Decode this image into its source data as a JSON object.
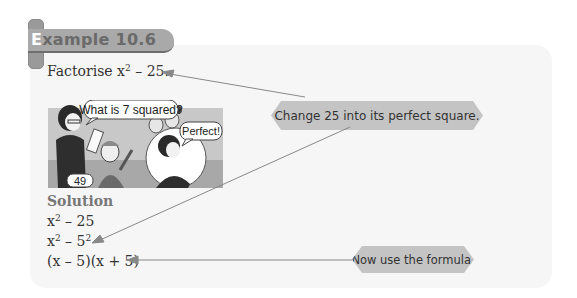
{
  "header": {
    "title_first_letter": "E",
    "title_rest": "xample 10.6"
  },
  "question": {
    "prefix": "Factorise x",
    "exp": "2",
    "suffix": " – 25."
  },
  "illustration": {
    "teacher_bubble": "What is 7 squared?",
    "student_bubble": "49",
    "teacher_reply_bubble": "Perfect!"
  },
  "callouts": [
    {
      "text": "Change 25 into its perfect square."
    },
    {
      "text": "Now use the formula."
    }
  ],
  "solution": {
    "label": "Solution",
    "steps": [
      {
        "base": "x",
        "exp": "2",
        "rest": " – 25"
      },
      {
        "base": "x",
        "exp": "2",
        "mid": " – 5",
        "exp2": "2"
      },
      {
        "text": "(x – 5)(x + 5)"
      }
    ]
  },
  "colors": {
    "panel_bg": "#f6f6f6",
    "tab_bg": "#a9a9a9",
    "callout_bg": "#c4c4c4",
    "arrow": "#888888"
  }
}
